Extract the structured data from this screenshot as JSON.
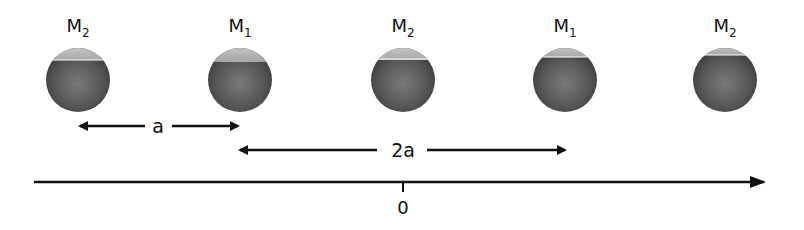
{
  "diagram": {
    "masses": [
      {
        "name": "M",
        "sub": "2",
        "x": 78
      },
      {
        "name": "M",
        "sub": "1",
        "x": 240
      },
      {
        "name": "M",
        "sub": "2",
        "x": 403
      },
      {
        "name": "M",
        "sub": "1",
        "x": 565
      },
      {
        "name": "M",
        "sub": "2",
        "x": 725
      }
    ],
    "spacing_a": {
      "label": "a"
    },
    "spacing_2a": {
      "label": "2a"
    },
    "axis": {
      "origin_label": "0"
    },
    "colors": {
      "sphere_dark": "#4a4a4a",
      "sphere_mid": "#7a7a7a",
      "sphere_light": "#c8c8c8",
      "line": "#111111"
    }
  }
}
